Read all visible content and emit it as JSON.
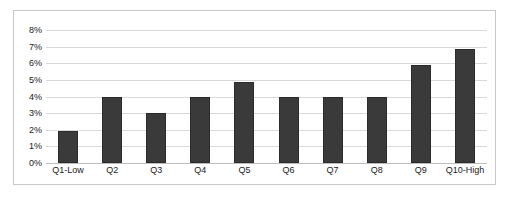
{
  "chart_data": {
    "type": "bar",
    "title": "",
    "subtitle": "",
    "xlabel": "",
    "ylabel": "",
    "categories": [
      "Q1-Low",
      "Q2",
      "Q3",
      "Q4",
      "Q5",
      "Q6",
      "Q7",
      "Q8",
      "Q9",
      "Q10-High"
    ],
    "values": [
      1.9,
      4.0,
      3.0,
      4.0,
      4.85,
      4.0,
      4.0,
      4.0,
      5.9,
      6.85
    ],
    "ylim": [
      0,
      8
    ],
    "ytick_values": [
      0,
      1,
      2,
      3,
      4,
      5,
      6,
      7,
      8
    ],
    "ytick_labels": [
      "0%",
      "1%",
      "2%",
      "3%",
      "4%",
      "5%",
      "6%",
      "7%",
      "8%"
    ],
    "grid": "horizontal",
    "legend": "none",
    "annotations": [],
    "colors": {
      "bar_fill": "#3a3a3a",
      "bar_border": "#2b2b2b",
      "gridline": "#d9d9d9",
      "baseline": "#bdbdbd",
      "frame_border": "#c8c8c8",
      "background": "#ffffff",
      "tick_label": "#1a1a1a"
    }
  }
}
